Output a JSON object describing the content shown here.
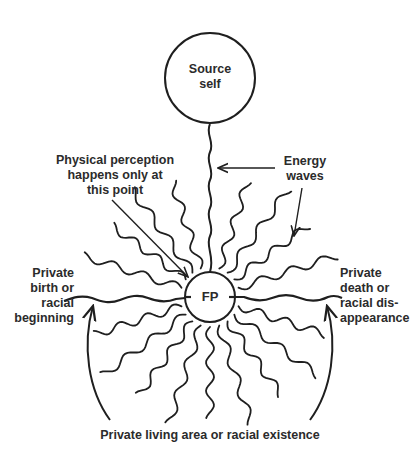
{
  "diagram": {
    "source_node": {
      "label": "Source\nself"
    },
    "focal_node": {
      "label": "FP"
    },
    "labels": {
      "perception": "Physical perception\nhappens only at\nthis point",
      "energy_waves": "Energy\nwaves",
      "birth": "Private\nbirth or\nracial\nbeginning",
      "death": "Private\ndeath or\nracial dis-\nappearance",
      "living_area": "Private living area or racial existence"
    },
    "colors": {
      "ink": "#1f1f1f",
      "background": "#ffffff"
    }
  }
}
